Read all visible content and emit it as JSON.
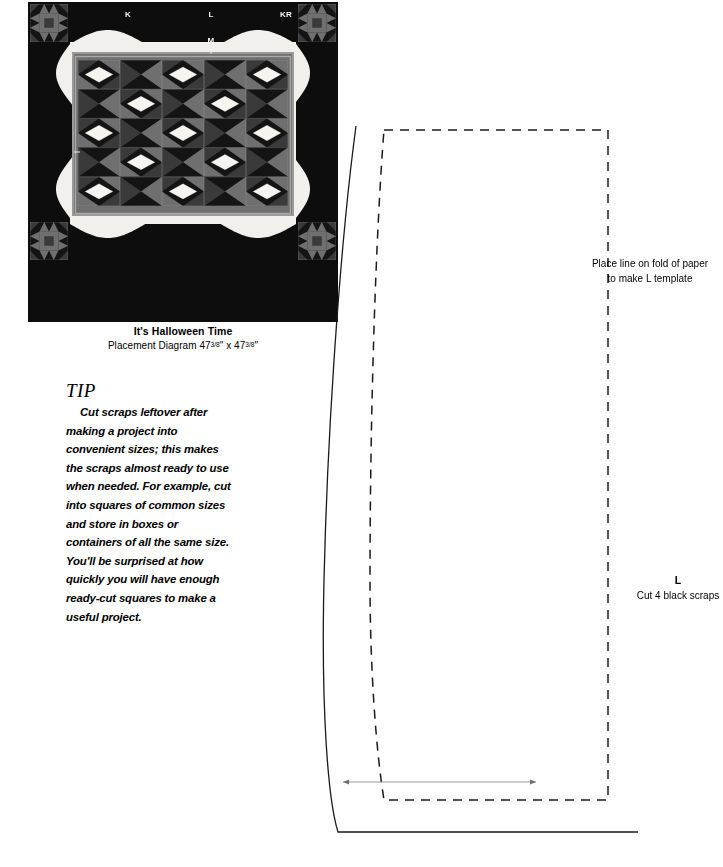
{
  "quilt": {
    "labels": [
      {
        "name": "K",
        "x": 100,
        "y": 8
      },
      {
        "name": "L",
        "x": 183,
        "y": 8
      },
      {
        "name": "KR",
        "x": 258,
        "y": 8
      },
      {
        "name": "M",
        "x": 183,
        "y": 34
      }
    ],
    "caption": {
      "title": "It's Halloween Time",
      "subtitle_prefix": "Placement Diagram 47",
      "subtitle_frac1": "3/8",
      "subtitle_mid": "\" x 47",
      "subtitle_frac2": "3/8",
      "subtitle_suffix": "\""
    },
    "colors": {
      "background": "#0d0d0d",
      "border_light": "#f2f0ec",
      "sash": "#9a9a9a",
      "dark": "#141414",
      "mid_dark": "#3a3a3a",
      "mid": "#6f6f6f",
      "light": "#f5f4f0",
      "orange_dark": "#4a4a4a"
    }
  },
  "tip": {
    "heading": "TIP",
    "body": "Cut scraps leftover after making a project into convenient sizes; this makes the scraps almost ready to use when needed. For example, cut into squares of common sizes and store in boxes or containers of all the same size. You'll be surprised at how quickly you will have enough ready-cut squares to make a useful project."
  },
  "template": {
    "fold_note_line1": "Place line on fold of paper",
    "fold_note_line2": "to make L template",
    "name": "L",
    "cut_instruction": "Cut 4 black scraps",
    "line_color": "#1a1a1a",
    "grainline_color": "#8a8a8a"
  }
}
